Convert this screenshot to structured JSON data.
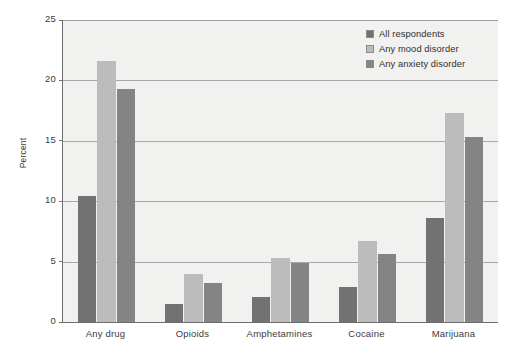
{
  "chart_data": {
    "type": "bar",
    "title": "",
    "xlabel": "",
    "ylabel": "Percent",
    "ylim": [
      0,
      25
    ],
    "yticks": [
      0,
      5,
      10,
      15,
      20,
      25
    ],
    "ytick_labels": [
      "0",
      "5",
      "10",
      "15",
      "20",
      "25"
    ],
    "grid": true,
    "grid_axis": "y",
    "legend_position": "top-right",
    "categories": [
      "Any drug",
      "Opioids",
      "Amphetamines",
      "Cocaine",
      "Marijuana"
    ],
    "series": [
      {
        "name": "All respondents",
        "color": "#727272",
        "values": [
          10.4,
          1.5,
          2.1,
          2.9,
          8.6
        ]
      },
      {
        "name": "Any mood disorder",
        "color": "#bcbcbc",
        "values": [
          21.6,
          4.0,
          5.3,
          6.7,
          17.3
        ]
      },
      {
        "name": "Any anxiety disorder",
        "color": "#848484",
        "values": [
          19.3,
          3.2,
          4.9,
          5.6,
          15.3
        ]
      }
    ]
  },
  "legend": {
    "items": [
      {
        "label": "All respondents",
        "color": "#727272"
      },
      {
        "label": "Any mood disorder",
        "color": "#bcbcbc"
      },
      {
        "label": "Any anxiety disorder",
        "color": "#848484"
      }
    ]
  },
  "axes": {
    "y_title": "Percent",
    "y_tick_labels": [
      "25",
      "20",
      "15",
      "10",
      "5",
      "0"
    ],
    "x_tick_labels": [
      "Any drug",
      "Opioids",
      "Amphetamines",
      "Cocaine",
      "Marijuana"
    ]
  },
  "style": {
    "plot_background": "#f1f1f0",
    "page_background": "#ffffff",
    "axis_color": "#6e6e6e",
    "gridline_color": "#9b9b9b",
    "text_color": "#3b3b3b"
  }
}
